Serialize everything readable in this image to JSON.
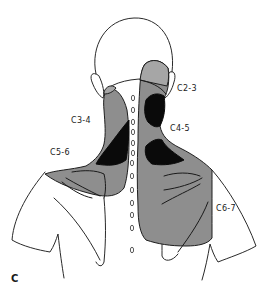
{
  "figure": {
    "panel_label": "C",
    "zones": [
      {
        "id": "C2-3",
        "label": "C2-3",
        "shade": "gray"
      },
      {
        "id": "C3-4",
        "label": "C3-4",
        "shade": "gray"
      },
      {
        "id": "C4-5",
        "label": "C4-5",
        "shade": "gray"
      },
      {
        "id": "C5-6",
        "label": "C5-6",
        "shade": "gray"
      },
      {
        "id": "C6-7",
        "label": "C6-7",
        "shade": "gray"
      }
    ],
    "spinous_process_markers": 13,
    "colors": {
      "outline": "#2a2a2a",
      "zone_gray": "#8e8e8e",
      "zone_black": "#0a0a0a",
      "background": "#ffffff"
    }
  }
}
